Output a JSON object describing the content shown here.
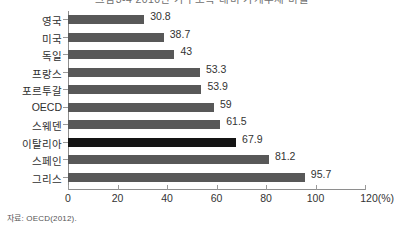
{
  "title": "그림3-4 2010년 가구소득 대비 가계부채 비율",
  "source_note": "자료: OECD(2012).",
  "axis_unit_label": "120(%)",
  "colors": {
    "bar": "#585858",
    "bar_highlight": "#141414",
    "axis": "#8e8e8e",
    "text": "#333333",
    "background": "#ffffff"
  },
  "chart_data": {
    "type": "bar",
    "orientation": "horizontal",
    "title": "그림3-4 2010년 가구소득 대비 가계부채 비율",
    "xlabel": "(%)",
    "ylabel": "",
    "xlim": [
      0,
      120
    ],
    "xticks": [
      0,
      20,
      40,
      60,
      80,
      100,
      120
    ],
    "xticklabels": [
      "0",
      "20",
      "40",
      "60",
      "80",
      "100",
      "120(%)"
    ],
    "grid": false,
    "legend": false,
    "highlight_category": "이탈리아",
    "categories": [
      "영국",
      "미국",
      "독일",
      "프랑스",
      "포르투갈",
      "OECD",
      "스웨덴",
      "이탈리아",
      "스페인",
      "그리스"
    ],
    "values": [
      30.8,
      38.7,
      43,
      53.3,
      53.9,
      59,
      61.5,
      67.9,
      81.2,
      95.7
    ],
    "value_labels": [
      "30.8",
      "38.7",
      "43",
      "53.3",
      "53.9",
      "59",
      "61.5",
      "67.9",
      "81.2",
      "95.7"
    ]
  }
}
